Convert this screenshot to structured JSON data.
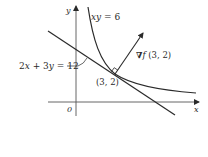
{
  "diagram": {
    "axes": {
      "x_label": "x",
      "y_label": "y",
      "origin_label": "0"
    },
    "curve": {
      "label": "xy = 6",
      "label_parts": {
        "var": "xy",
        "rest": " = 6"
      }
    },
    "tangent_line": {
      "label": "2x + 3y = 12",
      "label_parts": {
        "a": "2",
        "x": "x",
        "mid": " + 3",
        "y": "y",
        "rest": " = 12"
      }
    },
    "point": {
      "label": "(3, 2)"
    },
    "gradient": {
      "label": "∇f (3, 2)",
      "label_parts": {
        "nabla": "∇",
        "f": "f",
        "args": " (3, 2)"
      }
    },
    "colors": {
      "stroke": "#2a2a2a",
      "background": "#ffffff"
    }
  }
}
